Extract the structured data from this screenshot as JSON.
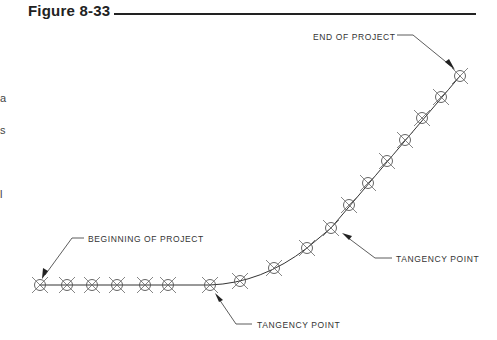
{
  "figure": {
    "title": "Figure 8-33"
  },
  "edge_text": [
    "a",
    "s",
    "l"
  ],
  "labels": {
    "end": "END OF PROJECT",
    "beginning": "BEGINNING OF PROJECT",
    "tangency_upper": "TANGENCY POINT",
    "tangency_lower": "TANGENCY POINT"
  },
  "colors": {
    "line": "#333333",
    "marker": "#555555",
    "text": "#333333"
  }
}
